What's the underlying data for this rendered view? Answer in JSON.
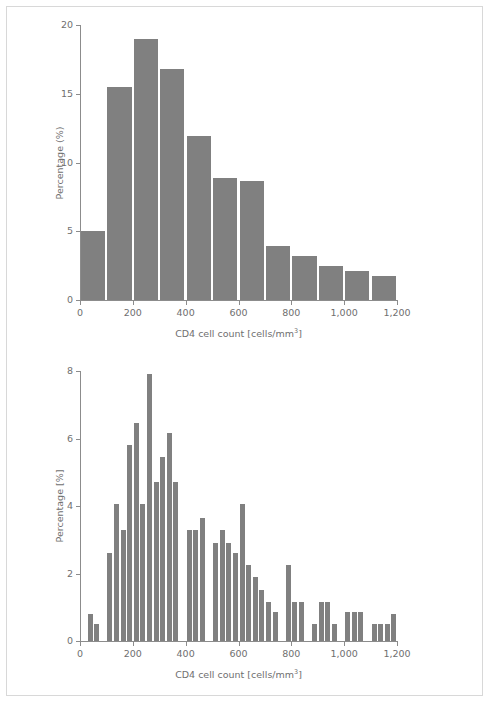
{
  "figure": {
    "background_color": "#ffffff",
    "frame_color": "#d8d8d8",
    "bar_color": "#808080",
    "axis_color": "#8c8c8c",
    "text_color": "#6f6f6f"
  },
  "panels": [
    {
      "id": "top",
      "xlabel_prefix": "CD4 cell count [cells/mm",
      "xlabel_sup": "3",
      "xlabel_suffix": "]",
      "ylabel": "Percentage (%)",
      "x_tick_labels": [
        "0",
        "200",
        "400",
        "600",
        "800",
        "1,000",
        "1,200"
      ]
    },
    {
      "id": "bottom",
      "xlabel_prefix": "CD4 cell count [cells/mm",
      "xlabel_sup": "3",
      "xlabel_suffix": "]",
      "ylabel": "Percentage [%]",
      "x_tick_labels": [
        "0",
        "200",
        "400",
        "600",
        "800",
        "1,000",
        "1,200"
      ]
    }
  ],
  "chart_data": [
    {
      "type": "bar",
      "title": "",
      "subtitle": "",
      "xlabel": "CD4 cell count [cells/mm3]",
      "ylabel": "Percentage (%)",
      "xlim": [
        0,
        1200
      ],
      "ylim": [
        0,
        20
      ],
      "xticks": [
        0,
        200,
        400,
        600,
        800,
        1000,
        1200
      ],
      "xticklabels": [
        "0",
        "200",
        "400",
        "600",
        "800",
        "1,000",
        "1,200"
      ],
      "yticks": [
        0,
        5,
        10,
        15,
        20
      ],
      "yticklabels": [
        "0",
        "5",
        "10",
        "15",
        "20"
      ],
      "grid": false,
      "legend": null,
      "bin_width": 100,
      "bin_starts": [
        0,
        100,
        200,
        300,
        400,
        500,
        600,
        700,
        800,
        900,
        1000,
        1100
      ],
      "categories": [
        "0-100",
        "100-200",
        "200-300",
        "300-400",
        "400-500",
        "500-600",
        "600-700",
        "700-800",
        "800-900",
        "900-1000",
        "1000-1100",
        "1100-1200"
      ],
      "values": [
        5.05,
        15.5,
        19.0,
        16.8,
        11.9,
        8.9,
        8.65,
        3.95,
        3.2,
        2.45,
        2.1,
        1.75
      ]
    },
    {
      "type": "bar",
      "title": "",
      "subtitle": "",
      "xlabel": "CD4 cell count [cells/mm3]",
      "ylabel": "Percentage [%]",
      "xlim": [
        0,
        1200
      ],
      "ylim": [
        0,
        8
      ],
      "xticks": [
        0,
        200,
        400,
        600,
        800,
        1000,
        1200
      ],
      "xticklabels": [
        "0",
        "200",
        "400",
        "600",
        "800",
        "1,000",
        "1,200"
      ],
      "yticks": [
        0,
        2,
        4,
        6,
        8
      ],
      "yticklabels": [
        "0",
        "2",
        "4",
        "6",
        "8"
      ],
      "grid": false,
      "legend": null,
      "bin_width": 25,
      "bin_starts": [
        0,
        25,
        50,
        75,
        100,
        125,
        150,
        175,
        200,
        225,
        250,
        275,
        300,
        325,
        350,
        375,
        400,
        425,
        450,
        475,
        500,
        525,
        550,
        575,
        600,
        625,
        650,
        675,
        700,
        725,
        750,
        775,
        800,
        825,
        850,
        875,
        900,
        925,
        950,
        975,
        1000,
        1025,
        1050,
        1075,
        1100,
        1125,
        1150,
        1175
      ],
      "values": [
        0.0,
        0.8,
        0.5,
        0.0,
        2.6,
        4.05,
        3.3,
        5.8,
        6.45,
        4.05,
        7.9,
        4.7,
        5.45,
        6.15,
        4.7,
        0.0,
        3.3,
        3.3,
        3.65,
        0.0,
        2.9,
        3.3,
        2.9,
        2.6,
        4.05,
        2.25,
        1.9,
        1.5,
        1.15,
        0.85,
        0.0,
        2.25,
        1.15,
        1.15,
        0.0,
        0.5,
        1.15,
        1.15,
        0.5,
        0.0,
        0.85,
        0.85,
        0.85,
        0.0,
        0.5,
        0.5,
        0.5,
        0.8
      ]
    }
  ]
}
